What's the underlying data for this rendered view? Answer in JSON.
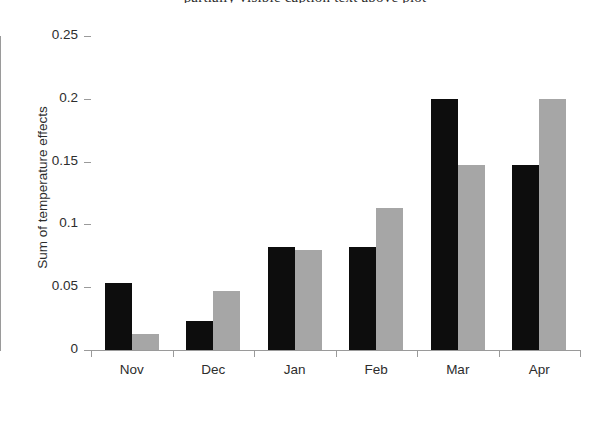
{
  "figure": {
    "clipped_caption": "partially visible caption text above plot"
  },
  "chart_data": {
    "type": "bar",
    "title": "",
    "xlabel": "",
    "ylabel": "Sum of temperature effects",
    "categories": [
      "Nov",
      "Dec",
      "Jan",
      "Feb",
      "Mar",
      "Apr"
    ],
    "series": [
      {
        "name": "series-1",
        "color": "#0d0d0d",
        "values": [
          0.053,
          0.023,
          0.082,
          0.082,
          0.2,
          0.147
        ]
      },
      {
        "name": "series-2",
        "color": "#a6a6a6",
        "values": [
          0.013,
          0.047,
          0.08,
          0.113,
          0.147,
          0.2
        ]
      }
    ],
    "ylim": [
      0,
      0.25
    ],
    "ytick_labels": [
      "0",
      "0.05",
      "0.1",
      "0.15",
      "0.2",
      "0.25"
    ],
    "ytick_values": [
      0,
      0.05,
      0.1,
      0.15,
      0.2,
      0.25
    ],
    "grid": false,
    "legend": "none",
    "axis_color": "#9a9a9a"
  }
}
